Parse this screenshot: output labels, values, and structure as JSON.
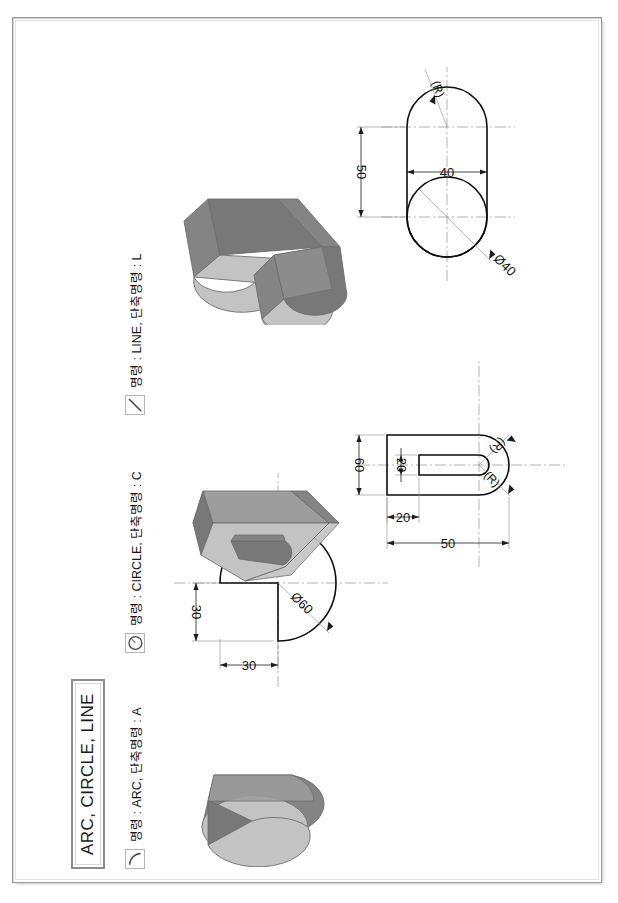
{
  "sheet": {
    "title": "ARC, CIRCLE, LINE"
  },
  "legend": [
    {
      "icon": "arc-icon",
      "label": "명령 : ARC, 단축명령 : A"
    },
    {
      "icon": "circle-icon",
      "label": "명령 : CIRCLE, 단축명령 : C"
    },
    {
      "icon": "line-icon",
      "label": "명령 : LINE, 단축명령 : L"
    }
  ],
  "drawings": [
    {
      "name": "arc-exercise",
      "command": "ARC",
      "shape": "circle-with-quadrant-notch",
      "dimensions": [
        {
          "label": "30",
          "kind": "linear-horizontal"
        },
        {
          "label": "30",
          "kind": "linear-vertical"
        },
        {
          "label": "Ø60",
          "kind": "diameter"
        }
      ]
    },
    {
      "name": "circle-exercise",
      "command": "CIRCLE",
      "shape": "u-slot-profile",
      "dimensions": [
        {
          "label": "60",
          "kind": "linear-horizontal"
        },
        {
          "label": "50",
          "kind": "linear-vertical"
        },
        {
          "label": "20",
          "kind": "linear-vertical"
        },
        {
          "label": "20",
          "kind": "linear-horizontal"
        },
        {
          "label": "(R)",
          "kind": "radius"
        },
        {
          "label": "(R)",
          "kind": "radius"
        }
      ]
    },
    {
      "name": "line-exercise",
      "command": "LINE",
      "shape": "obround-with-circle",
      "dimensions": [
        {
          "label": "50",
          "kind": "linear-horizontal"
        },
        {
          "label": "40",
          "kind": "linear-vertical"
        },
        {
          "label": "Ø40",
          "kind": "diameter"
        },
        {
          "label": "(R)",
          "kind": "radius"
        }
      ]
    }
  ],
  "colors": {
    "line": "#0d0d0d",
    "center_line": "#9e9e9e",
    "iso_light": "#c3c3c3",
    "iso_mid": "#9d9d9d",
    "iso_dark": "#848484",
    "frame": "#9a9a9a"
  }
}
